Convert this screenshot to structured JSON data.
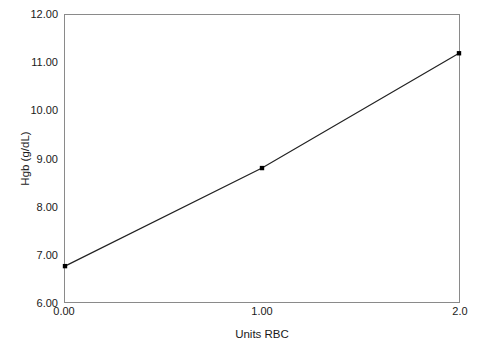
{
  "chart_data": {
    "type": "line",
    "title": "",
    "xlabel": "Units RBC",
    "ylabel": "Hgb (g/dL)",
    "xlim": [
      0,
      2
    ],
    "ylim": [
      6,
      12
    ],
    "grid": false,
    "legend": null,
    "x": [
      0,
      1,
      2
    ],
    "series": [
      {
        "name": "Hgb",
        "values": [
          6.75,
          8.8,
          11.2
        ],
        "line_color": "#222222",
        "marker": "square",
        "marker_color": "#000000"
      }
    ],
    "xticks": [
      {
        "value": 0,
        "label": "0.00"
      },
      {
        "value": 1,
        "label": "1.00"
      },
      {
        "value": 2,
        "label": "2.0"
      }
    ],
    "yticks": [
      {
        "value": 12,
        "label": "12.00"
      },
      {
        "value": 11,
        "label": "11.00"
      },
      {
        "value": 10,
        "label": "10.00"
      },
      {
        "value": 9,
        "label": "9.00"
      },
      {
        "value": 8,
        "label": "8.00"
      },
      {
        "value": 7,
        "label": "7.00"
      },
      {
        "value": 6,
        "label": "6.00"
      }
    ]
  },
  "figure": {
    "background_color": "#ffffff",
    "frame_color": "#8a8a8a",
    "text_color": "#1a1a1a"
  }
}
